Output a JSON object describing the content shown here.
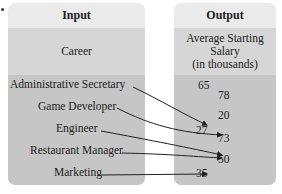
{
  "input": {
    "header": "Input",
    "subheader": "Career",
    "items": [
      "Administrative Secretary",
      "Game Developer",
      "Engineer",
      "Restaurant Manager",
      "Marketing"
    ]
  },
  "output": {
    "header": "Output",
    "subheader_line1": "Average Starting",
    "subheader_line2": "Salary",
    "subheader_line3": "(in thousands)",
    "values": [
      "65",
      "78",
      "20",
      "27",
      "73",
      "50",
      "35"
    ]
  },
  "mapping": [
    {
      "from": "Administrative Secretary",
      "to": "27"
    },
    {
      "from": "Game Developer",
      "to": "73"
    },
    {
      "from": "Engineer",
      "to": "50"
    },
    {
      "from": "Restaurant Manager",
      "to": "50"
    },
    {
      "from": "Marketing",
      "to": "35"
    }
  ]
}
